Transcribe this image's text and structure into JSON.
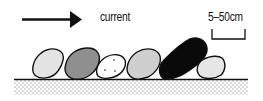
{
  "diagram": {
    "current_label": "current",
    "scale_label": "5–50cm",
    "arrow_direction": "right",
    "colors": {
      "outline": "#111111",
      "clast_light": "#e3e3e3",
      "clast_medium": "#8f8f8f",
      "clast_white": "#ffffff",
      "clast_silver": "#cfcfcf",
      "clast_black": "#0a0a0a",
      "clast_pale": "#e6e6e6",
      "substrate_dots": "#555555"
    },
    "clasts": [
      {
        "name": "clast-1",
        "fill": "light gray"
      },
      {
        "name": "clast-2",
        "fill": "medium gray"
      },
      {
        "name": "clast-3",
        "fill": "white with dots"
      },
      {
        "name": "clast-4",
        "fill": "light gray"
      },
      {
        "name": "clast-5",
        "fill": "black"
      },
      {
        "name": "clast-6",
        "fill": "pale gray"
      }
    ],
    "substrate": "stippled sediment bed"
  }
}
